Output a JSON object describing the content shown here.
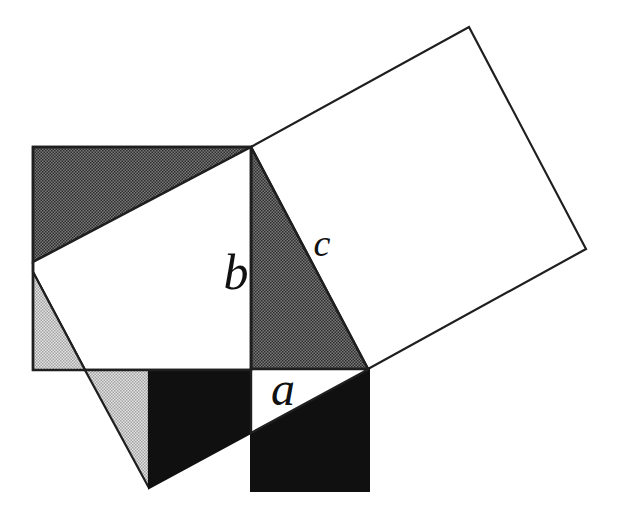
{
  "figure": {
    "labels": {
      "a": {
        "text": "a",
        "x": "283",
        "y": "405"
      },
      "b": {
        "text": "b",
        "x": "236",
        "y": "289"
      },
      "c": {
        "text": "c",
        "x": "322",
        "y": "256"
      }
    },
    "colors": {
      "white": "#ffffff",
      "outline": "#1f1f1f",
      "black_fill": "#101010",
      "label_ink": "#111111",
      "dark_halftone_bg": "#787878",
      "dark_halftone_dot": "#2e2e2e",
      "light_halftone_bg": "#e4e4e4",
      "light_halftone_dot": "#a2a2a2"
    },
    "shapes": {
      "square_on_c": "251,147 469,27 586,249 368,369",
      "dark_triangle_right": "251,147 368,369 251,369",
      "dark_triangle_top_left": "33,147 251,147 33,262",
      "white_pentagon_overlap": "251,147 33,262 33,272 85,370 251,370",
      "light_triangle_left": "33,272 85,370 33,370",
      "light_triangle_bottom": "85,370 149,370 149,488",
      "black_quad_bottom_left": "149,370 251,370 251,433 149,488",
      "black_region_a_square": "251,433 369,369 369,491 251,491",
      "white_triangle_a": "251,369 369,369 251,433",
      "b_square_outline": "33,147 251,147 251,370 33,370"
    }
  }
}
